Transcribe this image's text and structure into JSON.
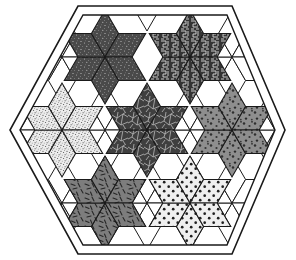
{
  "figure": {
    "type": "geometric-tiling-illustration",
    "background_color": "#ffffff",
    "line_color": "#1a1a1a",
    "canvas": {
      "width": 296,
      "height": 260
    }
  },
  "frame": {
    "name": "hexagon-border",
    "style": "double-line",
    "outer_points": "78,6 232,6 285,130 232,254 78,254 10,130",
    "inner_points": "83,15 227,15 275,130 227,245 83,245 20,130",
    "stroke_width": 1.6
  },
  "geometry": {
    "rhombus_long_radius": 47,
    "rhombus_short_radius": 27,
    "star_points": 6,
    "note": "each star = 6 rhombi meeting at a common centre"
  },
  "stars": [
    {
      "id": "star-top-left",
      "label": "Top-left star",
      "center": [
        105,
        57
      ],
      "rotation": 0,
      "fill": "#4a4a4a",
      "pattern": "fine-speckle-dark",
      "pattern_description": "dark grey with fine light speckles"
    },
    {
      "id": "star-top-right",
      "label": "Top-right star",
      "center": [
        190,
        57
      ],
      "rotation": 0,
      "fill": "#3b3b3b",
      "pattern": "maze-squiggle",
      "pattern_description": "near-black with light squiggle / maze lines"
    },
    {
      "id": "star-left",
      "label": "Left star",
      "center": [
        62,
        130
      ],
      "rotation": 0,
      "fill": "#e8e8e8",
      "pattern": "pepper-dots-light",
      "pattern_description": "near-white with dense fine black pepper dots"
    },
    {
      "id": "star-center",
      "label": "Centre star",
      "center": [
        147,
        130
      ],
      "rotation": 0,
      "fill": "#3f3f3f",
      "pattern": "crackle-web",
      "pattern_description": "dark grey with pale crackle / web veining"
    },
    {
      "id": "star-right",
      "label": "Right star",
      "center": [
        232,
        130
      ],
      "rotation": 0,
      "fill": "#8e8e8e",
      "pattern": "coarse-dots-grey",
      "pattern_description": "mid grey with coarse dark dots"
    },
    {
      "id": "star-bottom-left",
      "label": "Bottom-left star",
      "center": [
        105,
        203
      ],
      "rotation": 0,
      "fill": "#7d7d7d",
      "pattern": "dashes-grey",
      "pattern_description": "mid grey with short dark dashes / sticks"
    },
    {
      "id": "star-bottom-right",
      "label": "Bottom-right star",
      "center": [
        190,
        203
      ],
      "rotation": 0,
      "fill": "#efefef",
      "pattern": "polka-dots-light",
      "pattern_description": "very light with regular black polka dots"
    }
  ],
  "gaps": {
    "name": "white-rhombi",
    "fill": "#ffffff",
    "count": 12,
    "description": "unfilled white rhombi between adjacent stars and around the rim"
  },
  "legend": {
    "visible": false,
    "entries": []
  }
}
